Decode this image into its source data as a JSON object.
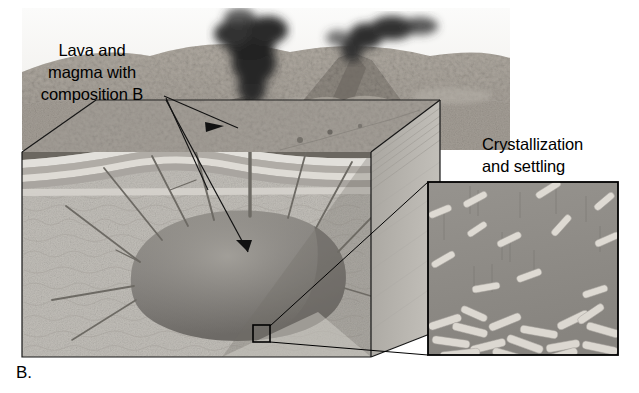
{
  "figure": {
    "panel_letter": "B.",
    "type": "geologic-block-diagram",
    "palette": {
      "background": "#ffffff",
      "ink": "#000000",
      "surface_terrain_light": "#b9b3aa",
      "surface_terrain_mid": "#9a948c",
      "surface_terrain_dark": "#6e6a64",
      "sky": "#f4f4f2",
      "ash_plume": "#2c2c2c",
      "strata_light": "#d9d6d0",
      "strata_dark": "#a9a5a0",
      "bedrock": "#c6c3bd",
      "bedrock_side": "#b4b1ac",
      "magma_chamber": "#8a8782",
      "magma_chamber_dark": "#6f6c68",
      "dike": "#6b6862",
      "inset_matrix": "#8e8b86",
      "crystal": "#ddd9d2"
    }
  },
  "labels": {
    "lava_magma": "Lava and\nmagma with\ncomposition B",
    "crystallization": "Crystallization\nand settling"
  },
  "annotations": {
    "arrow_to_lava_flow": "leader line from composition B text to surface lava flow",
    "arrow_to_chamber": "arrow from composition B text into the magma chamber",
    "inset_marker": "small black square on the magma chamber wall marking the magnified area",
    "inset_connector": "lines connecting the marker square to the magnified inset box"
  },
  "scene": {
    "volcanoes": [
      {
        "name": "near-cone",
        "erupting": true,
        "plume": "dark ash column"
      },
      {
        "name": "far-cone",
        "erupting": true,
        "plume": "dark ash cloud drifting right"
      }
    ],
    "lava_flows": 3,
    "dikes": 11,
    "strata_layers": 6,
    "inset": {
      "title": "Crystallization and settling",
      "suspended_crystals": 12,
      "settled_crystal_pile": true,
      "crystal_shape": "elongated laths/rods"
    }
  }
}
